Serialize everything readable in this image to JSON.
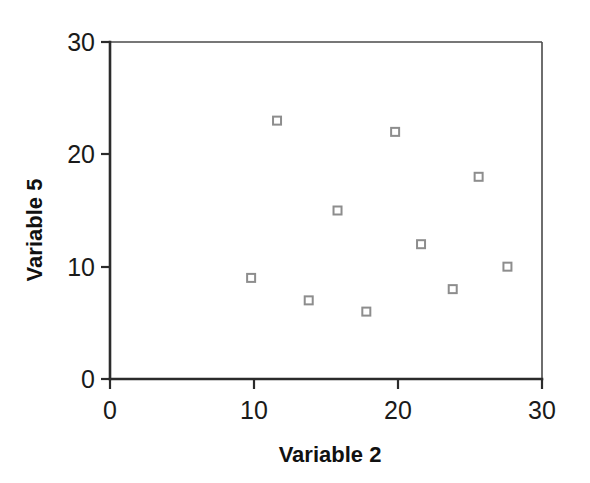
{
  "chart_data": {
    "type": "scatter",
    "title": "",
    "xlabel": "Variable 2",
    "ylabel": "Variable 5",
    "xlim": [
      0,
      30
    ],
    "ylim": [
      0,
      30
    ],
    "xticks": [
      "0",
      "10",
      "20",
      "30"
    ],
    "yticks": [
      "0",
      "10",
      "20",
      "30"
    ],
    "xtick_values": [
      0,
      10,
      20,
      30
    ],
    "ytick_values": [
      0,
      10,
      20,
      30
    ],
    "grid": false,
    "legend": null,
    "marker_style": "open-square",
    "marker_color": "#8d8d8d",
    "points": [
      {
        "x": 9.8,
        "y": 9
      },
      {
        "x": 11.6,
        "y": 23
      },
      {
        "x": 13.8,
        "y": 7
      },
      {
        "x": 15.8,
        "y": 15
      },
      {
        "x": 17.8,
        "y": 6
      },
      {
        "x": 19.8,
        "y": 22
      },
      {
        "x": 21.6,
        "y": 12
      },
      {
        "x": 23.8,
        "y": 8
      },
      {
        "x": 25.6,
        "y": 18
      },
      {
        "x": 27.6,
        "y": 10
      }
    ]
  },
  "axes": {
    "x_title": "Variable 2",
    "y_title": "Variable 5"
  },
  "colors": {
    "axis": "#2b2b2b",
    "frame": "#4a4a4a",
    "marker_stroke": "#8d8d8d",
    "text": "#111111",
    "background": "#ffffff"
  }
}
